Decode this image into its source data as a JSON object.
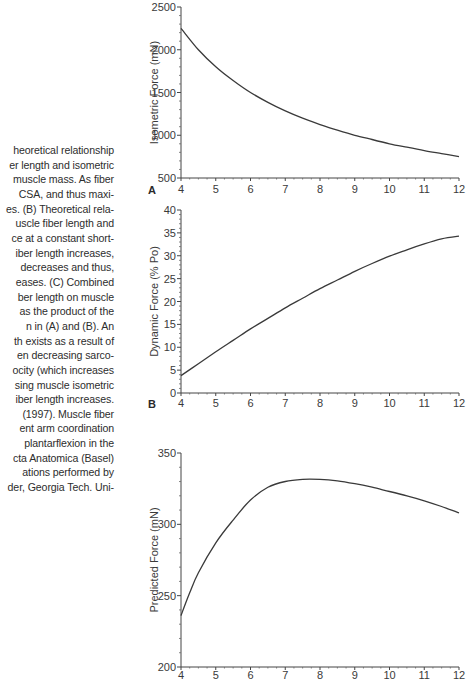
{
  "caption": {
    "lines": [
      "heoretical relationship",
      "er length and isometric",
      "muscle mass. As fiber",
      "CSA, and thus maxi-",
      "es. (B) Theoretical rela-",
      "uscle fiber length and",
      "ce at a constant short-",
      "iber length increases,",
      "decreases and thus,",
      "eases. (C) Combined",
      "ber length on muscle",
      "as the product of the",
      "n in (A) and (B). An",
      "th exists as a result of",
      "en decreasing sarco-",
      "ocity (which increases",
      "sing muscle isometric",
      "iber length increases.",
      "(1997). Muscle fiber",
      "ent arm coordination",
      "plantarflexion in the",
      "cta Anatomica (Basel)",
      "ations performed by",
      "der, Georgia Tech. Uni-"
    ]
  },
  "chart_data": [
    {
      "panel": "A",
      "type": "line",
      "title": "",
      "xlabel": "",
      "ylabel": "Isometric Force (mN)",
      "xlim": [
        4,
        12
      ],
      "ylim": [
        500,
        2500
      ],
      "xticks": [
        "4",
        "5",
        "6",
        "7",
        "8",
        "9",
        "10",
        "11",
        "12"
      ],
      "yticks": [
        "500",
        "1000",
        "1500",
        "2000",
        "2500"
      ],
      "grid": false,
      "x": [
        4,
        4.5,
        5,
        5.5,
        6,
        6.5,
        7,
        7.5,
        8,
        8.5,
        9,
        9.5,
        10,
        10.5,
        11,
        11.5,
        12
      ],
      "values": [
        2250,
        2000,
        1800,
        1640,
        1500,
        1385,
        1285,
        1200,
        1125,
        1060,
        1000,
        950,
        900,
        860,
        820,
        785,
        750
      ]
    },
    {
      "panel": "B",
      "type": "line",
      "title": "",
      "xlabel": "",
      "ylabel": "Dynamic Force (% Po)",
      "xlim": [
        4,
        12
      ],
      "ylim": [
        0,
        40
      ],
      "xticks": [
        "4",
        "5",
        "6",
        "7",
        "8",
        "9",
        "10",
        "11",
        "12"
      ],
      "yticks": [
        "0",
        "5",
        "10",
        "15",
        "20",
        "25",
        "30",
        "35",
        "40"
      ],
      "grid": false,
      "x": [
        4,
        4.5,
        5,
        5.5,
        6,
        6.5,
        7,
        7.5,
        8,
        8.5,
        9,
        9.5,
        10,
        10.5,
        11,
        11.5,
        12
      ],
      "values": [
        3.8,
        6.4,
        9.0,
        11.5,
        14.0,
        16.3,
        18.6,
        20.7,
        22.8,
        24.7,
        26.6,
        28.3,
        29.9,
        31.3,
        32.6,
        33.7,
        34.3
      ]
    },
    {
      "panel": "C",
      "type": "line",
      "title": "",
      "xlabel": "",
      "ylabel": "Predicted Force (mN)",
      "xlim": [
        4,
        12
      ],
      "ylim": [
        200,
        350
      ],
      "xticks": [
        "4",
        "5",
        "6",
        "7",
        "8",
        "9",
        "10",
        "11",
        "12"
      ],
      "yticks": [
        "200",
        "250",
        "300",
        "350"
      ],
      "grid": false,
      "x": [
        4,
        4.25,
        4.5,
        5,
        5.5,
        6,
        6.5,
        7,
        7.5,
        8,
        8.5,
        9,
        9.5,
        10,
        10.5,
        11,
        11.5,
        12
      ],
      "values": [
        236,
        252,
        266,
        287,
        303,
        317,
        326,
        330,
        331.5,
        331.5,
        330.5,
        328.5,
        326,
        323,
        320,
        316.5,
        312.5,
        308
      ]
    }
  ],
  "panels": {
    "A": {
      "label": "A"
    },
    "B": {
      "label": "B"
    },
    "C": {
      "label": "C"
    }
  }
}
